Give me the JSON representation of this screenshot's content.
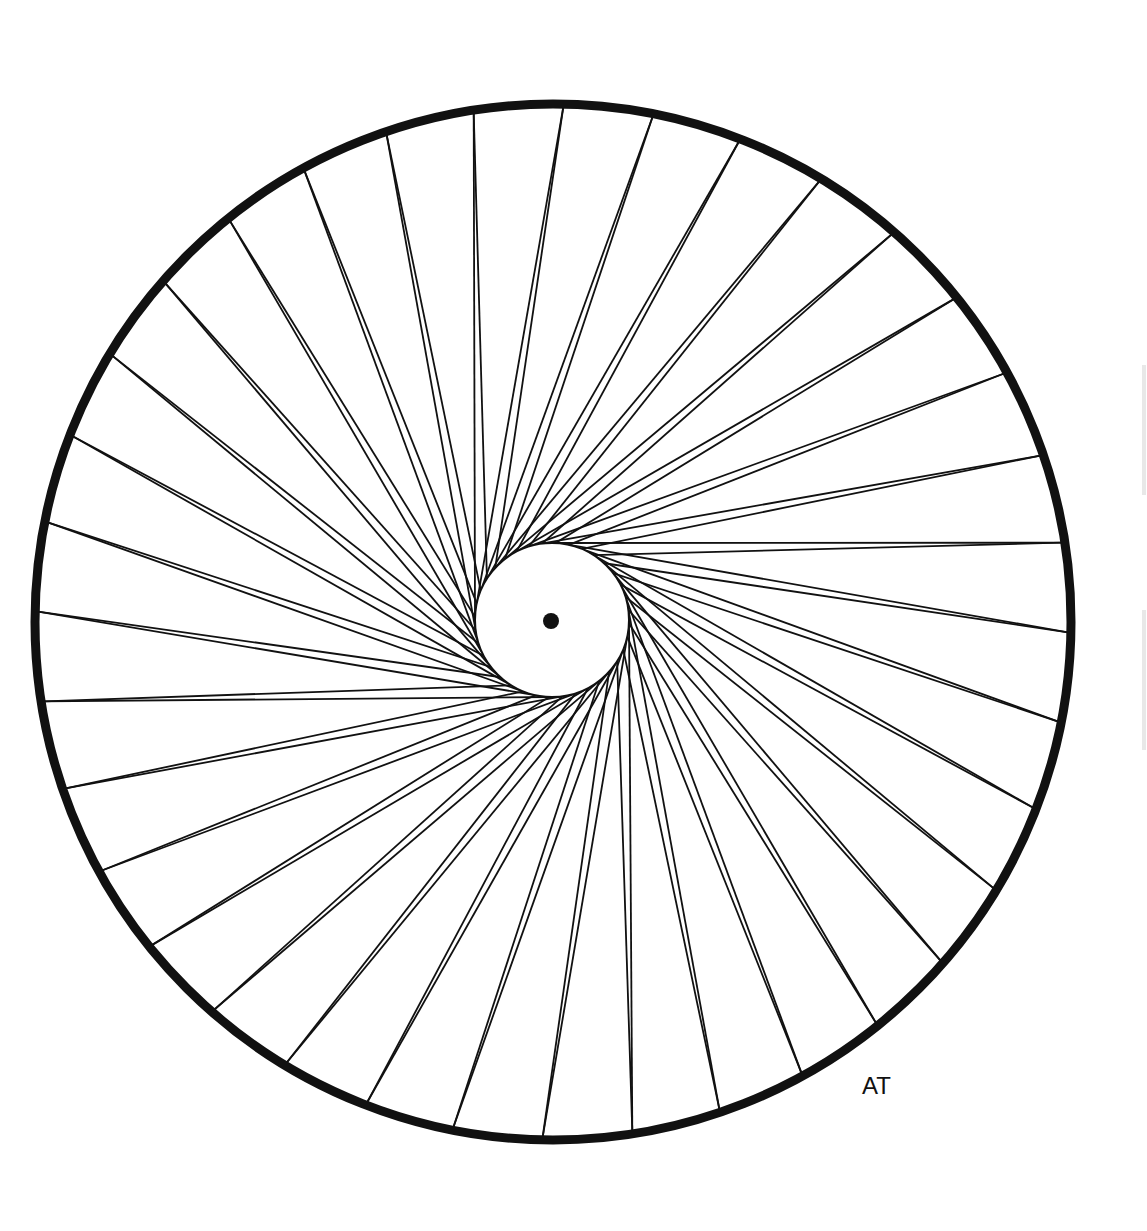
{
  "artwork": {
    "title": "Spoked wheel line drawing",
    "signature": "AT",
    "colors": {
      "ink": "#111111",
      "paper": "#ffffff"
    },
    "rim": {
      "cx": 553,
      "cy": 622,
      "r": 518,
      "stroke_width": 9
    },
    "hub": {
      "cx": 552,
      "cy": 620,
      "r": 77,
      "stroke_width": 2
    },
    "center_dot": {
      "r": 8
    },
    "spokes": {
      "rim_points": 36,
      "lines_per_point": 2,
      "tangent_to_hub": true,
      "stroke_width": 1.8
    }
  }
}
